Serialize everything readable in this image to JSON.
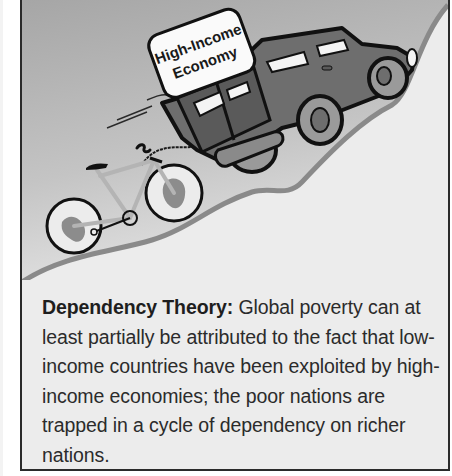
{
  "illustration": {
    "sign_label_line1": "High-Income",
    "sign_label_line2": "Economy",
    "description": "A dark SUV labeled High-Income Economy drives up a hill towing a bicycle whose wheels are globes",
    "colors": {
      "sky_top": "#a6a6a6",
      "sky_bottom": "#dcdcdc",
      "hill": "#ececec",
      "hill_edge": "#8a8a8a",
      "vehicle_body": "#6e6e6e",
      "vehicle_outline": "#111111",
      "bike_frame": "#b4b4b4",
      "globe_land": "#8c8c8c"
    }
  },
  "caption": {
    "term": "Dependency Theory:",
    "definition": " Global poverty can at least partially be attributed to the fact that low-income countries have been exploited by high-income economies; the poor nations are trapped in a cycle of dependency on richer nations."
  },
  "frame": {
    "border_color": "#2a2a2a",
    "background": "#ececec"
  }
}
